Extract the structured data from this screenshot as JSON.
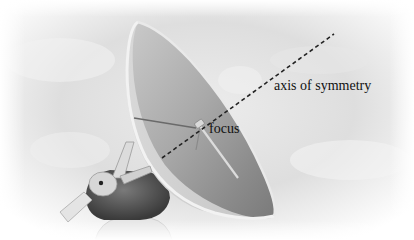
{
  "figure": {
    "labels": {
      "axis": "axis of symmetry",
      "focus": "focus"
    },
    "colors": {
      "sky": "#e4e4e4",
      "dish_inner": "#9a9a9a",
      "rim": "#eeeeee",
      "axis_line": "#222222",
      "text": "#111111"
    }
  }
}
